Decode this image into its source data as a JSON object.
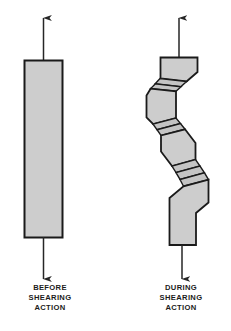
{
  "figure": {
    "background_color": "#ffffff",
    "bar_fill_color": "#cdcdcd",
    "bar_stroke_color": "#1a1a1a",
    "band_fill_color": "#c4c4c4",
    "arrow_color": "#262626",
    "text_color": "#1b1b1b"
  },
  "left_specimen": {
    "name": "before-shearing-specimen",
    "description": "undeformed rectangular bar",
    "top_arrow_direction": "up",
    "bottom_arrow_direction": "down"
  },
  "right_specimen": {
    "name": "during-shearing-specimen",
    "description": "bar displaced along diagonal shear planes",
    "top_arrow_direction": "up",
    "bottom_arrow_direction": "down",
    "shear_band_count": 4
  },
  "captions": {
    "before": {
      "line1": "BEFORE",
      "line2": "SHEARING",
      "line3": "ACTION"
    },
    "during": {
      "line1": "DURING",
      "line2": "SHEARING",
      "line3": "ACTION"
    }
  }
}
